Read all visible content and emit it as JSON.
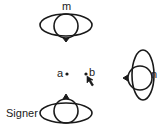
{
  "diagram": {
    "figures": {
      "m": {
        "label": "m",
        "facing": "down"
      },
      "n": {
        "label": "n",
        "facing": "left"
      },
      "signer": {
        "label": "Signer",
        "facing": "up"
      }
    },
    "loci": {
      "a": {
        "label": "a"
      },
      "b": {
        "label": "b"
      }
    },
    "colors": {
      "stroke": "#1a1a1a",
      "background": "#ffffff"
    }
  }
}
